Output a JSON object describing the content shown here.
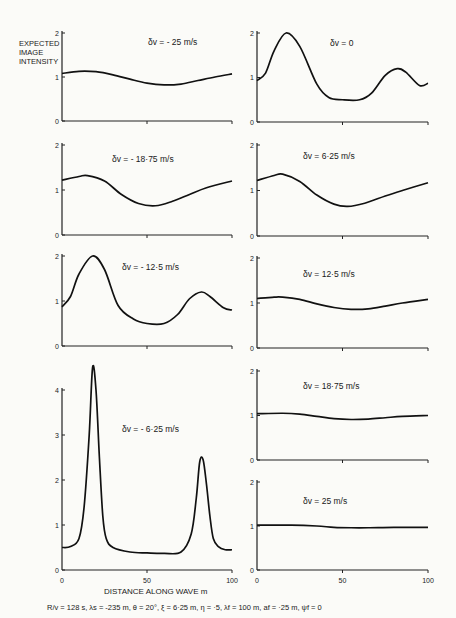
{
  "figure": {
    "ylabel_lines": [
      "EXPECTED",
      "IMAGE",
      "INTENSITY"
    ],
    "xlabel": "DISTANCE ALONG WAVE  m",
    "caption": "R/v = 128 s,  λs = -235 m,  θ = 20°,  ξ = 6·25 m,  η = ·5,  λf = 100 m,  af = ·25 m,  ψf = 0",
    "x_ticks": [
      "0",
      "50",
      "100"
    ]
  },
  "chart_data": [
    {
      "type": "line",
      "id": "p1",
      "title": "δv = - 25 m/s",
      "xlabel": "",
      "ylabel": "EXPECTED IMAGE INTENSITY",
      "xlim": [
        0,
        100
      ],
      "ylim": [
        0,
        2
      ],
      "yticks": [
        "0",
        "1",
        "2"
      ],
      "x": [
        0,
        10,
        20,
        30,
        40,
        50,
        60,
        70,
        80,
        90,
        100
      ],
      "values": [
        1.08,
        1.13,
        1.12,
        1.05,
        0.95,
        0.86,
        0.82,
        0.84,
        0.92,
        1.0,
        1.07
      ]
    },
    {
      "type": "line",
      "id": "p2",
      "title": "δv = 0",
      "xlim": [
        0,
        100
      ],
      "ylim": [
        0,
        2
      ],
      "yticks": [
        "0",
        "1",
        "2"
      ],
      "x": [
        0,
        5,
        10,
        17,
        25,
        35,
        42,
        50,
        60,
        67,
        75,
        82,
        87,
        95,
        100
      ],
      "values": [
        0.93,
        1.1,
        1.6,
        2.0,
        1.7,
        0.85,
        0.55,
        0.5,
        0.5,
        0.65,
        1.05,
        1.2,
        1.12,
        0.82,
        0.87
      ]
    },
    {
      "type": "line",
      "id": "p3",
      "title": "δv = - 18·75 m/s",
      "xlim": [
        0,
        100
      ],
      "ylim": [
        0,
        2
      ],
      "yticks": [
        "0",
        "1",
        "2"
      ],
      "x": [
        0,
        10,
        15,
        25,
        35,
        45,
        55,
        65,
        75,
        85,
        100
      ],
      "values": [
        1.22,
        1.3,
        1.32,
        1.2,
        0.9,
        0.7,
        0.65,
        0.75,
        0.9,
        1.05,
        1.2
      ]
    },
    {
      "type": "line",
      "id": "p4",
      "title": "δv = 6·25 m/s",
      "xlim": [
        0,
        100
      ],
      "ylim": [
        0,
        2
      ],
      "yticks": [
        "0",
        "1",
        "2"
      ],
      "x": [
        0,
        10,
        15,
        25,
        35,
        45,
        53,
        63,
        75,
        85,
        100
      ],
      "values": [
        1.22,
        1.33,
        1.36,
        1.2,
        0.9,
        0.7,
        0.65,
        0.72,
        0.88,
        1.0,
        1.17
      ]
    },
    {
      "type": "line",
      "id": "p5",
      "title": "δv = - 12·5 m/s",
      "xlim": [
        0,
        100
      ],
      "ylim": [
        0,
        2
      ],
      "yticks": [
        "0",
        "1",
        "2"
      ],
      "x": [
        0,
        5,
        10,
        18,
        25,
        33,
        42,
        50,
        60,
        68,
        75,
        82,
        87,
        95,
        100
      ],
      "values": [
        0.87,
        1.1,
        1.6,
        2.0,
        1.7,
        0.9,
        0.6,
        0.5,
        0.5,
        0.7,
        1.05,
        1.2,
        1.1,
        0.85,
        0.8
      ]
    },
    {
      "type": "line",
      "id": "p6",
      "title": "δv = 12·5 m/s",
      "xlim": [
        0,
        100
      ],
      "ylim": [
        0,
        2
      ],
      "yticks": [
        "0",
        "1",
        "2"
      ],
      "x": [
        0,
        10,
        15,
        25,
        35,
        45,
        55,
        65,
        75,
        85,
        100
      ],
      "values": [
        1.1,
        1.13,
        1.13,
        1.08,
        0.98,
        0.9,
        0.86,
        0.87,
        0.93,
        1.0,
        1.08
      ]
    },
    {
      "type": "line",
      "id": "p7",
      "title": "δv = - 6·25 m/s",
      "xlim": [
        0,
        100
      ],
      "ylim": [
        0,
        4.5
      ],
      "yticks": [
        "0",
        "1",
        "2",
        "3",
        "4"
      ],
      "x": [
        0,
        5,
        10,
        13,
        16,
        18,
        20,
        22,
        24,
        26,
        30,
        40,
        50,
        60,
        70,
        76,
        79,
        81,
        83,
        85,
        87,
        89,
        92,
        96,
        100
      ],
      "values": [
        0.5,
        0.52,
        0.7,
        1.4,
        3.0,
        4.5,
        4.0,
        2.5,
        1.2,
        0.7,
        0.5,
        0.4,
        0.38,
        0.37,
        0.4,
        0.8,
        1.6,
        2.4,
        2.45,
        1.9,
        1.2,
        0.7,
        0.52,
        0.45,
        0.45
      ]
    },
    {
      "type": "line",
      "id": "p8",
      "title": "δv = 18·75 m/s",
      "xlim": [
        0,
        100
      ],
      "ylim": [
        0,
        2
      ],
      "yticks": [
        "0",
        "1",
        "2"
      ],
      "x": [
        0,
        15,
        25,
        35,
        45,
        55,
        65,
        75,
        85,
        100
      ],
      "values": [
        1.04,
        1.05,
        1.03,
        0.98,
        0.93,
        0.91,
        0.92,
        0.95,
        0.98,
        1.0
      ]
    },
    {
      "type": "line",
      "id": "p9",
      "title": "δv = 25 m/s",
      "xlim": [
        0,
        100
      ],
      "ylim": [
        0,
        2
      ],
      "yticks": [
        "0",
        "1",
        "2"
      ],
      "x": [
        0,
        20,
        35,
        45,
        55,
        65,
        80,
        100
      ],
      "values": [
        1.02,
        1.02,
        1.0,
        0.97,
        0.96,
        0.96,
        0.97,
        0.97
      ]
    }
  ]
}
